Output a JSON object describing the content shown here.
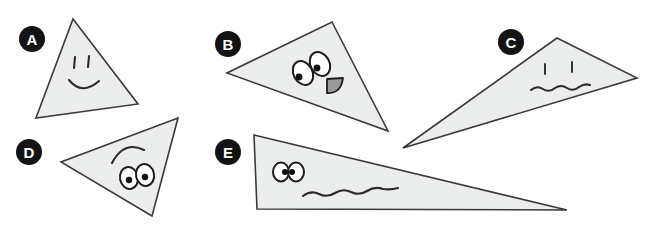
{
  "page": {
    "width": 654,
    "height": 225,
    "background_color": "#ffffff"
  },
  "style": {
    "shape_fill_color": "#eceded",
    "shape_stroke_color": "#3a3a3a",
    "label_circle_color": "#131313",
    "label_text_color": "#ffffff",
    "ink_color": "#2b2b2b",
    "eye_white_color": "#ffffff",
    "pupil_color": "#111111",
    "mouth_fill_color": "#9a9a9a"
  },
  "shapes": [
    {
      "id": "a",
      "label": "A",
      "label_circle": {
        "cx": 32,
        "cy": 39,
        "r": 13
      },
      "polygon_points": "73,19 138,104 36,118",
      "face": {
        "kind": "smiley-line-eyes",
        "eyes": [
          {
            "x1": 75,
            "y1": 57,
            "x2": 74,
            "y2": 68
          },
          {
            "x1": 89,
            "y1": 56,
            "x2": 88,
            "y2": 67
          }
        ],
        "mouth_path": "M 69 80 Q 82 96 99 81"
      }
    },
    {
      "id": "b",
      "label": "B",
      "label_circle": {
        "cx": 228,
        "cy": 44,
        "r": 13
      },
      "polygon_points": "332,22 388,131 227,73",
      "face": {
        "kind": "big-oval-eyes-with-fang-mouth",
        "eyes": [
          {
            "cx": 303,
            "cy": 73,
            "rx": 9.5,
            "ry": 12.5,
            "rotate": -28,
            "pupil_cx": 299,
            "pupil_cy": 77,
            "pupil_r": 3.4
          },
          {
            "cx": 320,
            "cy": 64,
            "rx": 9.5,
            "ry": 12.5,
            "rotate": -28,
            "pupil_cx": 317,
            "pupil_cy": 68,
            "pupil_r": 3.4
          }
        ],
        "mouth_path": "M 327 79 L 343 78 Q 341 94 327 93 Z"
      }
    },
    {
      "id": "c",
      "label": "C",
      "label_circle": {
        "cx": 511,
        "cy": 42,
        "r": 13
      },
      "polygon_points": "557,38 637,78 403,148",
      "face": {
        "kind": "line-eyes-with-wavy-mouth",
        "eyes": [
          {
            "x1": 545,
            "y1": 64,
            "x2": 545,
            "y2": 74
          },
          {
            "x1": 572,
            "y1": 62,
            "x2": 572,
            "y2": 72
          },
          {
            "x1": 545,
            "y1": 64,
            "x2": 545,
            "y2": 74
          }
        ],
        "mouth_path": "M 531 90 q 6 -5 12 -1 q 6 4 12 -1 q 6 -4 12 0 q 6 4 12 -1 q 6 -4 11 -2"
      }
    },
    {
      "id": "d",
      "label": "D",
      "label_circle": {
        "cx": 29,
        "cy": 152,
        "r": 13
      },
      "polygon_points": "178,118 152,216 61,162",
      "face": {
        "kind": "brow-with-oval-eyes",
        "brow_path": "M 112 163 Q 124 140 144 150",
        "eyes": [
          {
            "cx": 129,
            "cy": 178,
            "rx": 9,
            "ry": 11,
            "rotate": -12,
            "pupil_cx": 129,
            "pupil_cy": 180,
            "pupil_r": 3.2
          },
          {
            "cx": 145,
            "cy": 175,
            "rx": 9,
            "ry": 11,
            "rotate": -12,
            "pupil_cx": 145,
            "pupil_cy": 177,
            "pupil_r": 3.2
          }
        ]
      }
    },
    {
      "id": "e",
      "label": "E",
      "label_circle": {
        "cx": 228,
        "cy": 152,
        "r": 13
      },
      "polygon_points": "254,135 567,210 257,209",
      "face": {
        "kind": "small-overlapping-eyes-with-wavy-mouth",
        "eyes": [
          {
            "cx": 281,
            "cy": 172,
            "rx": 8,
            "ry": 9.5,
            "rotate": 0,
            "pupil_cx": 285,
            "pupil_cy": 172,
            "pupil_r": 3.0
          },
          {
            "cx": 296,
            "cy": 172,
            "rx": 8,
            "ry": 9.5,
            "rotate": 0,
            "pupil_cx": 292,
            "pupil_cy": 172,
            "pupil_r": 3.0
          }
        ],
        "mouth_path": "M 303 196 q 8 -6 16 -2 q 8 4 16 -1 q 8 -5 16 -1 q 8 4 16 -1 q 8 -5 16 -2 q 8 1 15 -1"
      }
    }
  ]
}
